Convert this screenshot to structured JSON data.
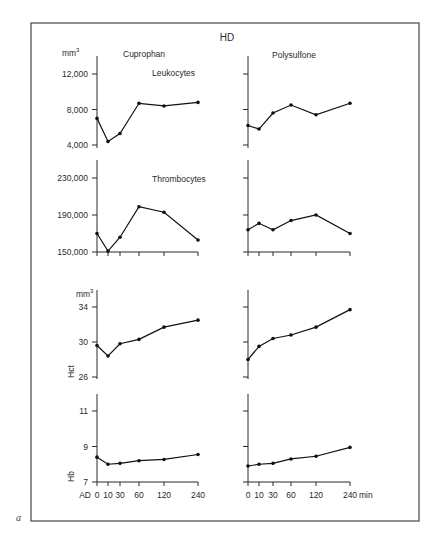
{
  "figure": {
    "title": "HD",
    "panel_letter": "a",
    "x_axis_first_label": "AD",
    "x_axis_unit": "min",
    "columns": [
      "Cuprophan",
      "Polysulfone"
    ]
  },
  "chart_data": [
    {
      "type": "line",
      "title": "Leukocytes",
      "column": "Cuprophan",
      "unit_label": "mm3",
      "x": [
        0,
        10,
        30,
        60,
        120,
        240
      ],
      "x_tick_labels": [
        "0",
        "10",
        "30",
        "60",
        "120",
        "240"
      ],
      "values": [
        7000,
        4400,
        5300,
        8700,
        8400,
        8800
      ],
      "y_ticks": [
        4000,
        8000,
        12000
      ],
      "y_tick_labels": [
        "4,000",
        "8,000",
        "12,000"
      ],
      "ylim": [
        4000,
        12000
      ]
    },
    {
      "type": "line",
      "title": "Leukocytes",
      "column": "Polysulfone",
      "x": [
        0,
        10,
        30,
        60,
        120,
        240
      ],
      "values": [
        6200,
        5800,
        7600,
        8500,
        7400,
        8700
      ],
      "y_ticks": [
        4000,
        8000,
        12000
      ],
      "ylim": [
        4000,
        12000
      ]
    },
    {
      "type": "line",
      "title": "Thrombocytes",
      "column": "Cuprophan",
      "x": [
        0,
        10,
        30,
        60,
        120,
        240
      ],
      "values": [
        170000,
        151000,
        166000,
        199000,
        193000,
        163000
      ],
      "y_ticks": [
        150000,
        190000,
        230000
      ],
      "y_tick_labels": [
        "150,000",
        "190,000",
        "230,000"
      ],
      "ylim": [
        150000,
        230000
      ]
    },
    {
      "type": "line",
      "title": "Thrombocytes",
      "column": "Polysulfone",
      "x": [
        0,
        10,
        30,
        60,
        120,
        240
      ],
      "values": [
        174000,
        181000,
        174000,
        184000,
        190000,
        170000
      ],
      "y_ticks": [
        150000,
        190000,
        230000
      ],
      "ylim": [
        150000,
        230000
      ]
    },
    {
      "type": "line",
      "title": "Hct",
      "column": "Cuprophan",
      "unit_label": "mm3",
      "x": [
        0,
        10,
        30,
        60,
        120,
        240
      ],
      "values": [
        29.6,
        28.4,
        29.8,
        30.3,
        31.7,
        32.5
      ],
      "y_ticks": [
        26,
        30,
        34
      ],
      "y_tick_labels": [
        "26",
        "30",
        "34"
      ],
      "ylim": [
        26,
        34
      ]
    },
    {
      "type": "line",
      "title": "Hct",
      "column": "Polysulfone",
      "x": [
        0,
        10,
        30,
        60,
        120,
        240
      ],
      "values": [
        28.0,
        29.5,
        30.4,
        30.8,
        31.7,
        33.7
      ],
      "y_ticks": [
        26,
        30,
        34
      ],
      "ylim": [
        26,
        34
      ]
    },
    {
      "type": "line",
      "title": "Hb",
      "column": "Cuprophan",
      "x": [
        0,
        10,
        30,
        60,
        120,
        240
      ],
      "x_tick_labels": [
        "AD 0",
        "10",
        "30",
        "60",
        "120",
        "240"
      ],
      "values": [
        8.4,
        8.0,
        8.05,
        8.2,
        8.27,
        8.55
      ],
      "y_ticks": [
        7,
        9,
        11
      ],
      "y_tick_labels": [
        "7",
        "9",
        "11"
      ],
      "ylim": [
        7,
        11
      ]
    },
    {
      "type": "line",
      "title": "Hb",
      "column": "Polysulfone",
      "x": [
        0,
        10,
        30,
        60,
        120,
        240
      ],
      "x_tick_labels": [
        "0",
        "10",
        "30",
        "60",
        "120",
        "240 min"
      ],
      "values": [
        7.9,
        8.0,
        8.05,
        8.3,
        8.45,
        8.95
      ],
      "y_ticks": [
        7,
        9,
        11
      ],
      "ylim": [
        7,
        11
      ]
    }
  ],
  "labels": {
    "leukocytes": "Leukocytes",
    "thrombocytes": "Thrombocytes",
    "hct": "Hct",
    "hb": "Hb",
    "mm3": "mm",
    "mm3_sup": "3",
    "cuprophan": "Cuprophan",
    "polysulfone": "Polysulfone",
    "ad": "AD",
    "min": "min"
  }
}
